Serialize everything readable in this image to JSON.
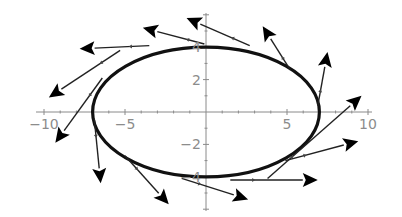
{
  "chart_data": {
    "type": "diagram",
    "title": "",
    "curve": {
      "shape": "ellipse",
      "center": [
        0,
        0
      ],
      "semi_axis_x": 7,
      "semi_axis_y": 4
    },
    "xlim": [
      -10.5,
      10.5
    ],
    "ylim": [
      -6,
      6
    ],
    "x_ticks": [
      {
        "value": -10,
        "label": "-10"
      },
      {
        "value": -5,
        "label": "-5"
      },
      {
        "value": 5,
        "label": "5"
      },
      {
        "value": 10,
        "label": "10"
      }
    ],
    "y_ticks": [
      {
        "value": 4,
        "label": "4"
      },
      {
        "value": 2,
        "label": "2"
      },
      {
        "value": -2,
        "label": "-2"
      },
      {
        "value": -4,
        "label": "-4"
      }
    ],
    "grid": false,
    "legend": null,
    "arrows": [
      {
        "from": [
          -5.3,
          3.8
        ],
        "to": [
          -9.7,
          0.9
        ]
      },
      {
        "from": [
          -3.5,
          4.1
        ],
        "to": [
          -7.8,
          3.9
        ]
      },
      {
        "from": [
          -0.1,
          4.2
        ],
        "to": [
          -3.9,
          5.2
        ]
      },
      {
        "from": [
          2.7,
          4.1
        ],
        "to": [
          -1.2,
          5.8
        ]
      },
      {
        "from": [
          5.2,
          2.6
        ],
        "to": [
          3.5,
          5.3
        ]
      },
      {
        "from": [
          6.9,
          0.4
        ],
        "to": [
          7.5,
          3.7
        ]
      },
      {
        "from": [
          3.8,
          -4.1
        ],
        "to": [
          9.6,
          1.0
        ]
      },
      {
        "from": [
          4.9,
          -3.0
        ],
        "to": [
          9.4,
          -1.8
        ]
      },
      {
        "from": [
          1.5,
          -4.2
        ],
        "to": [
          6.9,
          -4.2
        ]
      },
      {
        "from": [
          -1.5,
          -4.1
        ],
        "to": [
          2.6,
          -5.4
        ]
      },
      {
        "from": [
          -5.0,
          -2.7
        ],
        "to": [
          -2.3,
          -5.7
        ]
      },
      {
        "from": [
          -6.9,
          -0.4
        ],
        "to": [
          -6.5,
          -4.4
        ]
      },
      {
        "from": [
          -6.4,
          2.1
        ],
        "to": [
          -9.3,
          -1.9
        ]
      }
    ]
  },
  "pixel_mapping": {
    "origin_px": [
      206,
      112
    ],
    "px_per_unit": 16.2
  }
}
